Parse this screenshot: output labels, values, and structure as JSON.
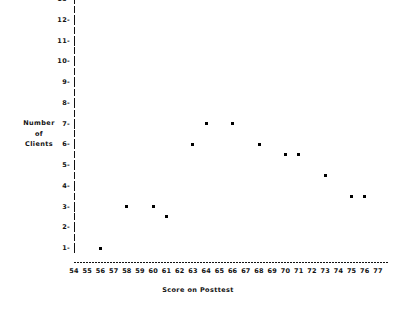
{
  "chart_data": {
    "type": "scatter",
    "title": "",
    "xlabel": "Score on Posttest",
    "ylabel_lines": [
      "Number",
      "of",
      "Clients"
    ],
    "ylabel": "Number of Clients",
    "xlim": [
      54,
      77
    ],
    "ylim": [
      1,
      13
    ],
    "grid": false,
    "legend": null,
    "xticks": [
      54,
      55,
      56,
      57,
      58,
      59,
      60,
      61,
      62,
      63,
      64,
      65,
      66,
      67,
      68,
      69,
      70,
      71,
      72,
      73,
      74,
      75,
      76,
      77
    ],
    "yticks": [
      1,
      2,
      3,
      4,
      5,
      6,
      7,
      8,
      9,
      10,
      11,
      12,
      13
    ],
    "marker_color": "#000000",
    "axis_color": "#111111",
    "background": "#ffffff",
    "points": [
      {
        "x": 56,
        "y": 1
      },
      {
        "x": 58,
        "y": 3
      },
      {
        "x": 60,
        "y": 3
      },
      {
        "x": 61,
        "y": 2.5
      },
      {
        "x": 63,
        "y": 6
      },
      {
        "x": 64,
        "y": 7
      },
      {
        "x": 66,
        "y": 7
      },
      {
        "x": 68,
        "y": 6
      },
      {
        "x": 70,
        "y": 5.5
      },
      {
        "x": 71,
        "y": 5.5
      },
      {
        "x": 73,
        "y": 4.5
      },
      {
        "x": 75,
        "y": 3.5
      },
      {
        "x": 76,
        "y": 3.5
      }
    ]
  }
}
